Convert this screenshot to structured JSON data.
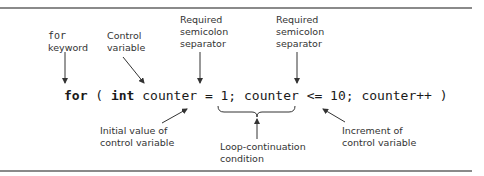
{
  "diagram": {
    "code": {
      "kw_for": "for",
      "open_paren": " ( ",
      "kw_int": "int",
      "init": " counter = 1;",
      "condition": " counter <= 10;",
      "increment": " counter++ )"
    },
    "annotations": {
      "for_keyword": {
        "code_word": "for",
        "text": "keyword"
      },
      "control_variable": {
        "line1": "Control",
        "line2": "variable"
      },
      "separator_1": {
        "line1": "Required",
        "line2": "semicolon",
        "line3": "separator"
      },
      "separator_2": {
        "line1": "Required",
        "line2": "semicolon",
        "line3": "separator"
      },
      "initial_value": {
        "line1": "Initial value of",
        "line2": "control variable"
      },
      "loop_condition": {
        "line1": "Loop-continuation",
        "line2": "condition"
      },
      "increment": {
        "line1": "Increment of",
        "line2": "control variable"
      }
    },
    "colors": {
      "rule": "#8a8a8a",
      "text": "#333333",
      "arrow": "#333333"
    }
  }
}
